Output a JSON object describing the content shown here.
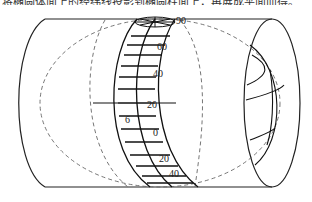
{
  "caption": "将椭圆体面上的经纬线投影到椭圆柱面上，再展成平面而得。",
  "diagram": {
    "labels": {
      "lat_90": "90",
      "lat_60": "60",
      "lat_40_n": "40",
      "lat_20_n": "20",
      "zone_width": "6",
      "lat_0": "0",
      "lat_20_s": "20",
      "lat_40_s": "40"
    },
    "colors": {
      "line": "#222222",
      "dashed": "#666666",
      "background": "#ffffff"
    }
  }
}
